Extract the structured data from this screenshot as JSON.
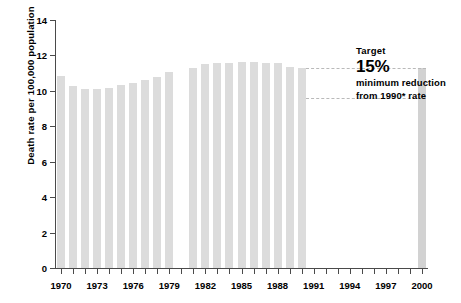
{
  "chart_data": {
    "type": "bar",
    "title": "",
    "subtitle": "",
    "xlabel": "",
    "ylabel": "Death rate per 100,000 population",
    "ylim": [
      0,
      14
    ],
    "ytick_values": [
      0,
      2,
      4,
      6,
      8,
      10,
      12,
      14
    ],
    "ytick_labels": [
      "0",
      "2",
      "4",
      "6",
      "8",
      "10",
      "12",
      "14"
    ],
    "xlim": [
      1969.5,
      2000.5
    ],
    "grid": false,
    "legend": "none",
    "x_tick_years": [
      1970,
      1971,
      1972,
      1973,
      1974,
      1975,
      1976,
      1977,
      1978,
      1979,
      1980,
      1981,
      1982,
      1983,
      1984,
      1985,
      1986,
      1987,
      1988,
      1989,
      1990,
      1991,
      1992,
      1993,
      1994,
      1995,
      1996,
      1997,
      1998,
      1999,
      2000
    ],
    "xtick_labels": [
      "1970",
      "1973",
      "1976",
      "1979",
      "1982",
      "1985",
      "1988",
      "1991",
      "1994",
      "1997",
      "2000"
    ],
    "xtick_label_years": [
      1970,
      1973,
      1976,
      1979,
      1982,
      1985,
      1988,
      1991,
      1994,
      1997,
      2000
    ],
    "categories": [
      1970,
      1971,
      1972,
      1973,
      1974,
      1975,
      1976,
      1977,
      1978,
      1979,
      1981,
      1982,
      1983,
      1984,
      1985,
      1986,
      1987,
      1988,
      1989,
      1990,
      2000
    ],
    "values": [
      10.85,
      10.25,
      10.1,
      10.1,
      10.15,
      10.35,
      10.45,
      10.6,
      10.8,
      11.05,
      11.3,
      11.5,
      11.55,
      11.6,
      11.65,
      11.65,
      11.6,
      11.6,
      11.35,
      11.3,
      11.3
    ],
    "missing_years": [
      1980
    ],
    "bar_color": "#dcdcdc",
    "target_bar_year": 2000,
    "target_bar_color": "#d2d2d2",
    "reference_lines": [
      {
        "name": "1990-rate-line",
        "value": 11.3,
        "style": "dashed",
        "color": "#b9b9b9"
      },
      {
        "name": "15-percent-reduction-line",
        "value": 9.6,
        "style": "dashed",
        "color": "#b9b9b9"
      }
    ]
  },
  "annotation": {
    "target_label": "Target",
    "percent": "15%",
    "line3": "minimum reduction",
    "line4": "from 1990* rate"
  }
}
